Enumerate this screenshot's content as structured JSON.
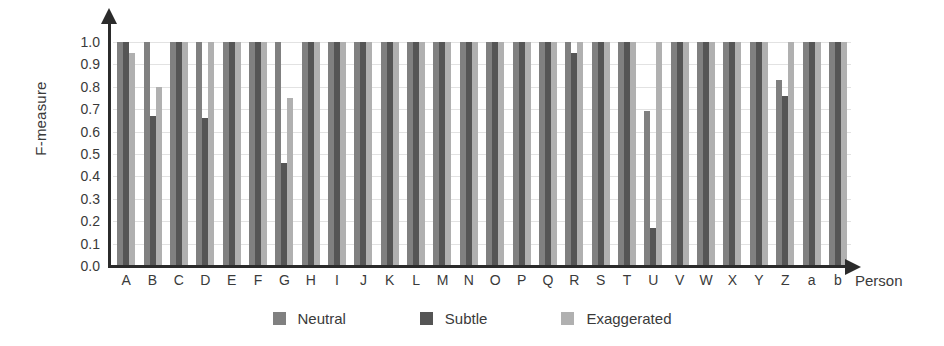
{
  "chart_data": {
    "type": "bar",
    "title": "",
    "xlabel": "Person",
    "ylabel": "F-measure",
    "ylim": [
      0.0,
      1.0
    ],
    "grid": true,
    "legend_position": "bottom-center",
    "y_ticks": [
      "1.0",
      "0.9",
      "0.8",
      "0.7",
      "0.6",
      "0.5",
      "0.4",
      "0.3",
      "0.2",
      "0.1",
      "0.0"
    ],
    "y_tick_values": [
      1.0,
      0.9,
      0.8,
      0.7,
      0.6,
      0.5,
      0.4,
      0.3,
      0.2,
      0.1,
      0.0
    ],
    "categories": [
      "A",
      "B",
      "C",
      "D",
      "E",
      "F",
      "G",
      "H",
      "I",
      "J",
      "K",
      "L",
      "M",
      "N",
      "O",
      "P",
      "Q",
      "R",
      "S",
      "T",
      "U",
      "V",
      "W",
      "X",
      "Y",
      "Z",
      "a",
      "b"
    ],
    "series": [
      {
        "name": "Neutral",
        "color": "#808080",
        "values": [
          1.0,
          1.0,
          1.0,
          1.0,
          1.0,
          1.0,
          1.0,
          1.0,
          1.0,
          1.0,
          1.0,
          1.0,
          1.0,
          1.0,
          1.0,
          1.0,
          1.0,
          1.0,
          1.0,
          1.0,
          0.69,
          1.0,
          1.0,
          1.0,
          1.0,
          0.83,
          1.0,
          1.0
        ]
      },
      {
        "name": "Subtle",
        "color": "#555555",
        "values": [
          1.0,
          0.67,
          1.0,
          0.66,
          1.0,
          1.0,
          0.46,
          1.0,
          1.0,
          1.0,
          1.0,
          1.0,
          1.0,
          1.0,
          1.0,
          1.0,
          1.0,
          0.95,
          1.0,
          1.0,
          0.17,
          1.0,
          1.0,
          1.0,
          1.0,
          0.76,
          1.0,
          1.0
        ]
      },
      {
        "name": "Exaggerated",
        "color": "#b0b0b0",
        "values": [
          0.95,
          0.8,
          1.0,
          1.0,
          1.0,
          1.0,
          0.75,
          1.0,
          1.0,
          1.0,
          1.0,
          1.0,
          1.0,
          1.0,
          1.0,
          1.0,
          1.0,
          1.0,
          1.0,
          1.0,
          1.0,
          1.0,
          1.0,
          1.0,
          1.0,
          1.0,
          1.0,
          1.0
        ]
      }
    ]
  },
  "axes": {
    "y_title": "F-measure",
    "x_title": "Person"
  },
  "legend": {
    "entries": [
      {
        "label": "Neutral",
        "color": "#808080",
        "swatch_name": "legend-swatch-neutral"
      },
      {
        "label": "Subtle",
        "color": "#555555",
        "swatch_name": "legend-swatch-subtle"
      },
      {
        "label": "Exaggerated",
        "color": "#b0b0b0",
        "swatch_name": "legend-swatch-exaggerated"
      }
    ]
  },
  "colors": {
    "neutral": "#808080",
    "subtle": "#555555",
    "exaggerated": "#b0b0b0",
    "axis": "#2b2b2b",
    "grid": "#e2e2e2",
    "text": "#3a3a3a",
    "background": "#ffffff"
  }
}
